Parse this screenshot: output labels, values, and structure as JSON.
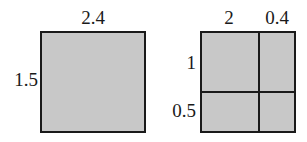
{
  "diagram": {
    "background_color": "#ffffff",
    "fill_color": "#c8c8c8",
    "stroke_color": "#1a1a1a"
  },
  "figures": [
    {
      "id": "whole-rectangle",
      "name": "undivided-rectangle",
      "width_label": "2.4",
      "height_label": "1.5",
      "geometry": {
        "x": 40,
        "y": 31,
        "w": 106,
        "h": 102
      },
      "labels": {
        "top": {
          "text": "2.4",
          "cx": 93,
          "y": 8
        },
        "left": {
          "text": "1.5",
          "right_x": 38,
          "cy": 80
        }
      }
    },
    {
      "id": "partitioned-rectangle",
      "name": "divided-rectangle",
      "geometry": {
        "x": 200,
        "y": 31,
        "w": 96,
        "h": 102
      },
      "divider_v_x": 258,
      "divider_h_y": 91,
      "column_labels": [
        {
          "text": "2",
          "cx": 229,
          "y": 8
        },
        {
          "text": "0.4",
          "cx": 277,
          "y": 8
        }
      ],
      "row_labels": [
        {
          "text": "1",
          "right_x": 196,
          "cy": 63
        },
        {
          "text": "0.5",
          "right_x": 196,
          "cy": 111
        }
      ],
      "cells": [
        {
          "name": "cell-top-left",
          "col": "2",
          "row": "1"
        },
        {
          "name": "cell-top-right",
          "col": "0.4",
          "row": "1"
        },
        {
          "name": "cell-bottom-left",
          "col": "2",
          "row": "0.5"
        },
        {
          "name": "cell-bottom-right",
          "col": "0.4",
          "row": "0.5"
        }
      ]
    }
  ]
}
